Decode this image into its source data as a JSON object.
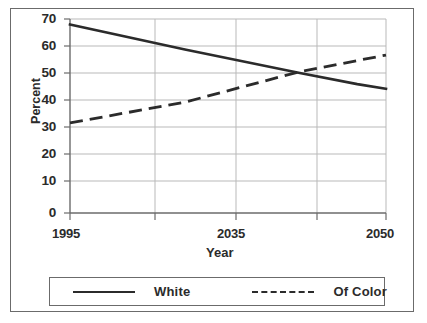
{
  "chart_data": {
    "type": "line",
    "title": "",
    "xlabel": "Year",
    "ylabel": "Percent",
    "ylim": [
      0,
      70
    ],
    "ytick_step": 10,
    "yticks": [
      "70",
      "60",
      "50",
      "40",
      "30",
      "20",
      "10",
      "0"
    ],
    "grid": true,
    "grid_color": "#b9b9b9",
    "axis_color": "#6b6b6b",
    "line_color": "#2b2b2b",
    "legend_position": "below-plot",
    "x": [
      1995,
      2015,
      2035,
      2045,
      2050
    ],
    "xticks_all": [
      "1995",
      "",
      "2035",
      "",
      "2050"
    ],
    "xtick_labels_visible": [
      {
        "label": "1995",
        "x": 1995
      },
      {
        "label": "2035",
        "x": 2035
      },
      {
        "label": "2050",
        "x": 2050
      }
    ],
    "series": [
      {
        "name": "White",
        "style": "solid",
        "values": [
          68,
          59,
          50.5,
          46.5,
          44.8
        ]
      },
      {
        "name": "Of Color",
        "style": "dashed",
        "values": [
          32.5,
          40,
          51,
          55,
          57
        ]
      }
    ],
    "annotations": [
      {
        "text": "lines cross near 2033 at about 51 percent"
      }
    ]
  },
  "axis": {
    "y_title": "Percent",
    "x_title": "Year"
  },
  "legend": {
    "entries": [
      {
        "label": "White",
        "style": "solid"
      },
      {
        "label": "Of Color",
        "style": "dashed"
      }
    ]
  }
}
